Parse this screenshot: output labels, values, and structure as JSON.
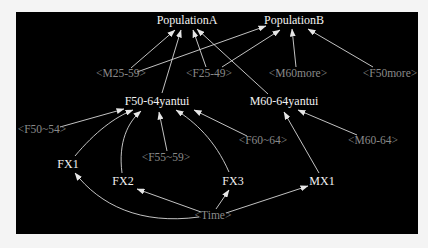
{
  "diagram": {
    "background": "#000000",
    "edge_color": "#d8d8d8",
    "nodes": {
      "popA": {
        "label": "PopulationA",
        "x": 187,
        "y": 20,
        "type": "latent"
      },
      "popB": {
        "label": "PopulationB",
        "x": 294,
        "y": 20,
        "type": "latent"
      },
      "m2559": {
        "label": "<M25-59>",
        "x": 121,
        "y": 74,
        "type": "observed"
      },
      "f2549": {
        "label": "<F25-49>",
        "x": 209,
        "y": 74,
        "type": "observed"
      },
      "m60more": {
        "label": "<M60more>",
        "x": 298,
        "y": 74,
        "type": "observed"
      },
      "f50more": {
        "label": "<F50more>",
        "x": 390,
        "y": 74,
        "type": "observed"
      },
      "f5064": {
        "label": "F50-64yantui",
        "x": 157,
        "y": 101,
        "type": "latent"
      },
      "m6064y": {
        "label": "M60-64yantui",
        "x": 284,
        "y": 101,
        "type": "latent"
      },
      "f5054": {
        "label": "<F50~54>",
        "x": 42,
        "y": 130,
        "type": "observed"
      },
      "f5559": {
        "label": "<F55~59>",
        "x": 166,
        "y": 158,
        "type": "observed"
      },
      "f6064": {
        "label": "<F60~64>",
        "x": 263,
        "y": 141,
        "type": "observed"
      },
      "m6064": {
        "label": "<M60-64>",
        "x": 373,
        "y": 141,
        "type": "observed"
      },
      "fx1": {
        "label": "FX1",
        "x": 68,
        "y": 164,
        "type": "latent"
      },
      "fx2": {
        "label": "FX2",
        "x": 123,
        "y": 181,
        "type": "latent"
      },
      "fx3": {
        "label": "FX3",
        "x": 233,
        "y": 181,
        "type": "latent"
      },
      "mx1": {
        "label": "MX1",
        "x": 322,
        "y": 181,
        "type": "latent"
      },
      "time": {
        "label": "<Time>",
        "x": 213,
        "y": 216,
        "type": "observed"
      }
    },
    "edges": [
      {
        "from": "m2559",
        "to": "popA"
      },
      {
        "from": "m2559",
        "to": "popB"
      },
      {
        "from": "f2549",
        "to": "popA"
      },
      {
        "from": "f2549",
        "to": "popB"
      },
      {
        "from": "f5064",
        "to": "popA"
      },
      {
        "from": "m6064y",
        "to": "popA"
      },
      {
        "from": "m60more",
        "to": "popB"
      },
      {
        "from": "f50more",
        "to": "popB"
      },
      {
        "from": "f5054",
        "to": "f5064"
      },
      {
        "from": "fx1",
        "to": "f5064"
      },
      {
        "from": "fx2",
        "to": "f5064"
      },
      {
        "from": "f5559",
        "to": "f5064"
      },
      {
        "from": "fx3",
        "to": "f5064"
      },
      {
        "from": "f6064",
        "to": "f5064"
      },
      {
        "from": "mx1",
        "to": "m6064y"
      },
      {
        "from": "m6064",
        "to": "m6064y"
      },
      {
        "from": "time",
        "to": "fx1"
      },
      {
        "from": "time",
        "to": "fx2"
      },
      {
        "from": "time",
        "to": "fx3"
      },
      {
        "from": "time",
        "to": "mx1"
      }
    ]
  }
}
